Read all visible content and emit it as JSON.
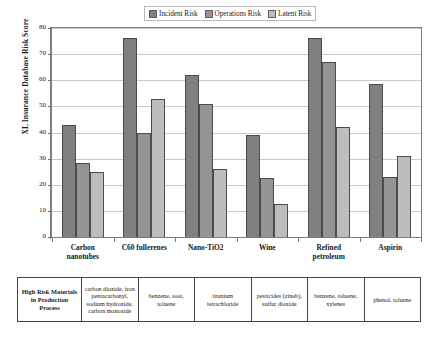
{
  "chart_data": {
    "type": "bar",
    "title": "",
    "xlabel": "",
    "ylabel": "XL Insurance Database Risk Score",
    "ylim": [
      0,
      80
    ],
    "ytick_step": 10,
    "yticks": [
      "0",
      "10",
      "20",
      "30",
      "40",
      "50",
      "60",
      "70",
      "80"
    ],
    "grid": true,
    "legend_position": "top-center",
    "categories": [
      "Carbon nanotubes",
      "C60 fullerenes",
      "Nano-TiO2",
      "Wine",
      "Refined petroleum",
      "Aspirin"
    ],
    "category_lines": [
      [
        "Carbon",
        "nanotubes"
      ],
      [
        "C60 fullerenes"
      ],
      [
        "Nano-TiO2"
      ],
      [
        "Wine"
      ],
      [
        "Refined",
        "petroleum"
      ],
      [
        "Aspirin"
      ]
    ],
    "series": [
      {
        "name": "Incident Risk",
        "color": "#808080",
        "values": [
          43,
          76,
          62,
          39,
          76,
          58.5
        ]
      },
      {
        "name": "Operations Risk",
        "color": "#949494",
        "values": [
          28.5,
          40,
          51,
          22.5,
          67,
          23
        ]
      },
      {
        "name": "Latent Risk",
        "color": "#bdbdbd",
        "values": [
          25,
          53,
          26,
          12.5,
          42,
          31
        ]
      }
    ]
  },
  "legend": {
    "items": [
      {
        "label": "Incident Risk",
        "color": "#808080"
      },
      {
        "label": "Operations Risk",
        "color": "#949494"
      },
      {
        "label": "Latent Risk",
        "color": "#bdbdbd"
      }
    ]
  },
  "materials_table": {
    "header": "High Risk Materials in Production Process",
    "cells": [
      "carbon dioxide, iron pentacarbonyl, sodium hydroxide, carbon monoxide",
      "benzene, soot, toluene",
      "titanium tetrachloride",
      "pesticides (zineb), sulfur dioxide",
      "benzene, toluene, xylenes",
      "phenol, toluene"
    ]
  }
}
